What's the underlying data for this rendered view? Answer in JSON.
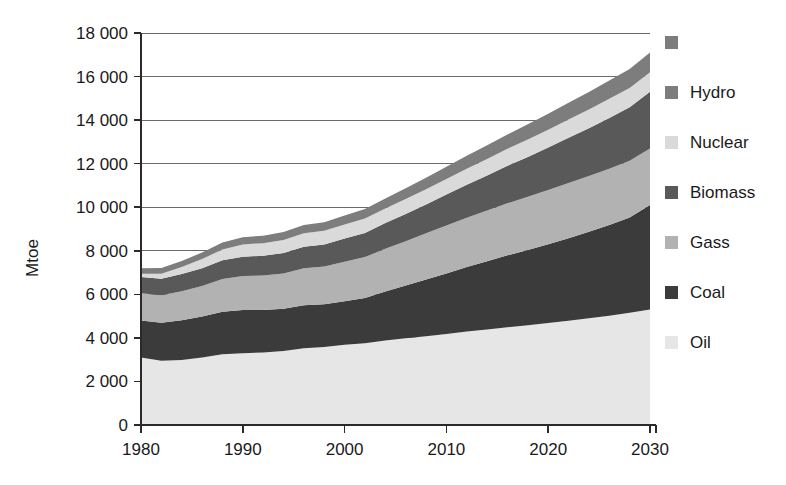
{
  "chart_data": {
    "type": "area",
    "stacked": true,
    "title": "",
    "subtitle": "",
    "xlabel": "",
    "ylabel": "Mtoe",
    "xlim": [
      1980,
      2030
    ],
    "ylim": [
      0,
      18000
    ],
    "grid": true,
    "legend_position": "right",
    "x_tick_labels": [
      "1980",
      "1990",
      "2000",
      "2010",
      "2020",
      "2030"
    ],
    "x_ticks": [
      1980,
      1990,
      2000,
      2010,
      2020,
      2030
    ],
    "y_tick_labels": [
      "0",
      "2 000",
      "4 000",
      "6 000",
      "8 000",
      "10 000",
      "12 000",
      "14 000",
      "16 000",
      "18 000"
    ],
    "y_ticks": [
      0,
      2000,
      4000,
      6000,
      8000,
      10000,
      12000,
      14000,
      16000,
      18000
    ],
    "x": [
      1980,
      1982,
      1984,
      1986,
      1988,
      1990,
      1992,
      1994,
      1996,
      1998,
      2000,
      2002,
      2004,
      2006,
      2008,
      2010,
      2012,
      2014,
      2016,
      2018,
      2020,
      2022,
      2024,
      2026,
      2028,
      2030
    ],
    "series": [
      {
        "name": "Oil",
        "color": "#e6e6e6",
        "values": [
          3100,
          2950,
          2980,
          3100,
          3250,
          3300,
          3330,
          3400,
          3520,
          3580,
          3680,
          3750,
          3880,
          3980,
          4080,
          4180,
          4290,
          4390,
          4490,
          4580,
          4680,
          4790,
          4900,
          5020,
          5150,
          5300
        ]
      },
      {
        "name": "Coal",
        "color": "#3b3b3b",
        "values": [
          1700,
          1750,
          1830,
          1880,
          1950,
          1980,
          1950,
          1940,
          1980,
          1960,
          2000,
          2080,
          2250,
          2420,
          2600,
          2780,
          2960,
          3130,
          3300,
          3460,
          3620,
          3790,
          3970,
          4160,
          4380,
          4800
        ]
      },
      {
        "name": "Gass",
        "color": "#b2b2b2",
        "values": [
          1250,
          1260,
          1330,
          1400,
          1500,
          1560,
          1580,
          1620,
          1700,
          1740,
          1820,
          1880,
          1960,
          2040,
          2120,
          2200,
          2270,
          2330,
          2390,
          2440,
          2490,
          2530,
          2560,
          2590,
          2600,
          2600
        ]
      },
      {
        "name": "Biomass",
        "color": "#595959",
        "values": [
          750,
          760,
          790,
          820,
          860,
          890,
          910,
          940,
          980,
          1010,
          1060,
          1110,
          1180,
          1250,
          1330,
          1420,
          1510,
          1610,
          1720,
          1830,
          1950,
          2080,
          2200,
          2330,
          2460,
          2600
        ]
      },
      {
        "name": "Nuclear",
        "color": "#dadada",
        "values": [
          150,
          220,
          320,
          420,
          500,
          560,
          580,
          600,
          620,
          630,
          650,
          660,
          670,
          690,
          700,
          720,
          740,
          760,
          780,
          800,
          820,
          840,
          860,
          880,
          890,
          900
        ]
      },
      {
        "name": "Hydro",
        "color": "#7d7d7d",
        "values": [
          250,
          265,
          285,
          300,
          320,
          335,
          345,
          360,
          380,
          395,
          415,
          435,
          460,
          490,
          520,
          555,
          590,
          625,
          660,
          695,
          730,
          765,
          800,
          835,
          870,
          900
        ]
      }
    ],
    "totals": [
      7200,
      7205,
      7535,
      7920,
      8380,
      8625,
      8695,
      8860,
      9180,
      9315,
      9625,
      9915,
      10400,
      10870,
      11350,
      11855,
      12360,
      12845,
      13340,
      13805,
      14290,
      14795,
      15290,
      15815,
      16350,
      17100
    ]
  },
  "axis": {
    "y_title": "Mtoe"
  },
  "legend": {
    "items": [
      {
        "label": "",
        "color": "#7d7d7d",
        "name": "legend-unlabeled"
      },
      {
        "label": "Hydro",
        "color": "#7d7d7d",
        "name": "legend-hydro"
      },
      {
        "label": "Nuclear",
        "color": "#dadada",
        "name": "legend-nuclear"
      },
      {
        "label": "Biomass",
        "color": "#595959",
        "name": "legend-biomass"
      },
      {
        "label": "Gass",
        "color": "#b2b2b2",
        "name": "legend-gass"
      },
      {
        "label": "Coal",
        "color": "#3b3b3b",
        "name": "legend-coal"
      },
      {
        "label": "Oil",
        "color": "#e6e6e6",
        "name": "legend-oil"
      }
    ]
  }
}
